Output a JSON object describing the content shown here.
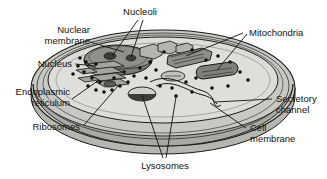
{
  "diagram": {
    "style": "grayscale line drawing",
    "colors": {
      "outline": "#1a1a1a",
      "cytoplasm": "#dcdcd8",
      "membrane_band": "#b0b0ab",
      "outer_shell": "#c7c7c2",
      "bowl_shadow": "#a8a8a3",
      "nucleus": "#8c8c88",
      "organelle": "#9a9a95",
      "ribosome": "#111111",
      "label_text": "#111111"
    },
    "labels": [
      {
        "id": "nucleoli",
        "text": "Nucleoli",
        "lines": [
          "Nucleoli"
        ]
      },
      {
        "id": "nuclear-membrane",
        "text": "Nuclear membrane",
        "lines": [
          "Nuclear",
          "membrane"
        ]
      },
      {
        "id": "nucleus",
        "text": "Nucleus",
        "lines": [
          "Nucleus"
        ]
      },
      {
        "id": "endoplasmic-reticulum",
        "text": "Endoplasmic reticulum",
        "lines": [
          "Endoplasmic",
          "reticulum"
        ]
      },
      {
        "id": "ribosomes",
        "text": "Ribosomes",
        "lines": [
          "Ribosomes"
        ]
      },
      {
        "id": "lysosomes",
        "text": "Lysosomes",
        "lines": [
          "Lysosomes"
        ]
      },
      {
        "id": "mitochondria",
        "text": "Mitochondria",
        "lines": [
          "Mitochondria"
        ]
      },
      {
        "id": "secretory-channel",
        "text": "Secretory channel",
        "lines": [
          "Secretory",
          "channel"
        ]
      },
      {
        "id": "cell-membrane",
        "text": "Cell membrane",
        "lines": [
          "Cell",
          "membrane"
        ]
      }
    ],
    "structures": [
      {
        "id": "nucleus-body",
        "name": "nucleus"
      },
      {
        "id": "nucleolus-1",
        "name": "nucleolus"
      },
      {
        "id": "nucleolus-2",
        "name": "nucleolus"
      },
      {
        "id": "er-stack",
        "name": "endoplasmic reticulum"
      },
      {
        "id": "mitochondrion-1",
        "name": "mitochondrion"
      },
      {
        "id": "mitochondrion-2",
        "name": "mitochondrion"
      },
      {
        "id": "mitochondrion-3",
        "name": "mitochondrion"
      },
      {
        "id": "lysosome-1",
        "name": "lysosome"
      },
      {
        "id": "lysosome-2",
        "name": "lysosome"
      },
      {
        "id": "secretory-tube",
        "name": "secretory channel"
      },
      {
        "id": "ribosome-dots",
        "name": "ribosomes"
      }
    ]
  }
}
